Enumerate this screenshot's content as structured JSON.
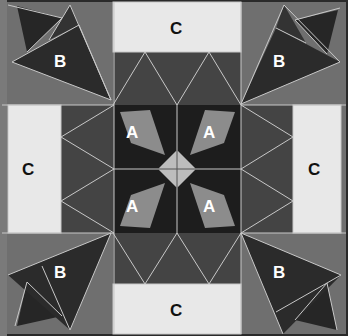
{
  "diagram": {
    "width": 348,
    "height": 336,
    "colors": {
      "frame": "#2a2a2a",
      "background": "#6f6f6f",
      "band": "#444444",
      "center": "#1d1d1d",
      "piece_a": "#8c8c8c",
      "piece_b_dark": "#2b2b2b",
      "piece_c": "#e8e8e8",
      "diamond": "#bdbdbd",
      "seam": "#c8c8c8"
    },
    "labels": {
      "c_top": "C",
      "c_left": "C",
      "c_right": "C",
      "c_bottom": "C",
      "b_top_left": "B",
      "b_top_right": "B",
      "b_bottom_left": "B",
      "b_bottom_right": "B",
      "a_top_left": "A",
      "a_top_right": "A",
      "a_bottom_left": "A",
      "a_bottom_right": "A"
    },
    "pieces": [
      {
        "id": "A",
        "count": 4,
        "description": "gray kite-shaped pieces around center diamond"
      },
      {
        "id": "B",
        "count": 4,
        "description": "dark triangles in each corner"
      },
      {
        "id": "C",
        "count": 4,
        "description": "light rectangles on each side"
      }
    ]
  }
}
